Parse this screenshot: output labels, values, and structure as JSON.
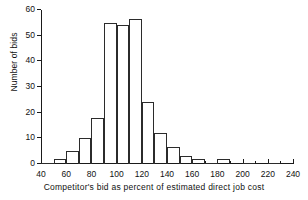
{
  "chart_data": {
    "type": "bar",
    "title": "",
    "subtitle": "",
    "xlabel": "Competitor's bid as  percent  of  estimated  direct  job  cost",
    "ylabel": "Number of bids",
    "grid": false,
    "legend": "none",
    "bin_width": 10,
    "xlim": [
      40,
      240
    ],
    "ylim": [
      0,
      60
    ],
    "xticks": [
      40,
      60,
      80,
      100,
      120,
      140,
      160,
      180,
      200,
      220,
      240
    ],
    "xticks_minor": [
      50,
      70,
      90,
      110,
      130,
      150,
      170,
      190,
      210,
      230
    ],
    "yticks": [
      0,
      10,
      20,
      30,
      40,
      50,
      60
    ],
    "bins": [
      {
        "x0": 40,
        "x1": 50,
        "value": 0.5
      },
      {
        "x0": 50,
        "x1": 60,
        "value": 2
      },
      {
        "x0": 60,
        "x1": 70,
        "value": 5
      },
      {
        "x0": 70,
        "x1": 80,
        "value": 10
      },
      {
        "x0": 80,
        "x1": 90,
        "value": 18
      },
      {
        "x0": 90,
        "x1": 100,
        "value": 55
      },
      {
        "x0": 100,
        "x1": 110,
        "value": 54
      },
      {
        "x0": 110,
        "x1": 120,
        "value": 56.5
      },
      {
        "x0": 120,
        "x1": 130,
        "value": 24
      },
      {
        "x0": 130,
        "x1": 140,
        "value": 12
      },
      {
        "x0": 140,
        "x1": 150,
        "value": 6.5
      },
      {
        "x0": 150,
        "x1": 160,
        "value": 3
      },
      {
        "x0": 160,
        "x1": 170,
        "value": 2
      },
      {
        "x0": 170,
        "x1": 180,
        "value": 0.4
      },
      {
        "x0": 180,
        "x1": 190,
        "value": 2
      },
      {
        "x0": 190,
        "x1": 200,
        "value": 0
      },
      {
        "x0": 200,
        "x1": 210,
        "value": 0.4
      },
      {
        "x0": 210,
        "x1": 220,
        "value": 0
      },
      {
        "x0": 220,
        "x1": 230,
        "value": 0.4
      },
      {
        "x0": 230,
        "x1": 240,
        "value": 0
      }
    ],
    "colors": {
      "axis": "#1a1a1a",
      "bar_stroke": "#2b2b2b",
      "bar_fill": "none",
      "background": "#ffffff",
      "text": "#111111"
    }
  }
}
